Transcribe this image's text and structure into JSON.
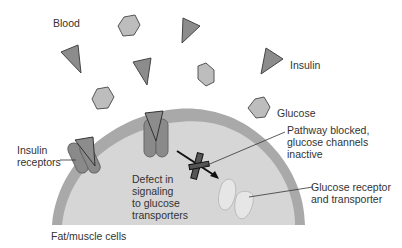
{
  "diagram": {
    "type": "biology-illustration",
    "regions": {
      "blood_label": "Blood",
      "cell_label": "Fat/muscle cells"
    },
    "legend": {
      "insulin_label": "Insulin",
      "glucose_label": "Glucose"
    },
    "annotations": {
      "insulin_receptors": [
        "Insulin",
        "receptors"
      ],
      "defect": [
        "Defect in",
        "signaling",
        "to glucose",
        "transporters"
      ],
      "pathway_blocked": [
        "Pathway blocked,",
        "glucose channels",
        "inactive"
      ],
      "glucose_receptor": [
        "Glucose receptor",
        "and transporter"
      ]
    },
    "colors": {
      "insulin_fill": "#8c8c8c",
      "glucose_fill": "#bdbdbd",
      "shape_stroke": "#555555",
      "membrane": "#a9a9a9",
      "cytoplasm": "#d4d4d4",
      "receptor": "#8a8a8a",
      "transporter": "#e6e6e6",
      "text": "#333333"
    }
  }
}
